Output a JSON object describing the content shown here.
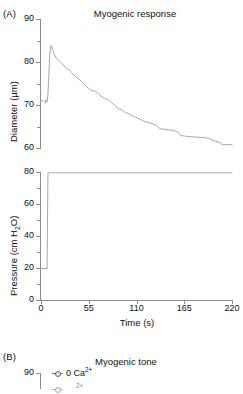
{
  "figure": {
    "panel_a_label": "(A)",
    "panel_b_label": "(B)"
  },
  "chart_data": [
    {
      "type": "line",
      "id": "myogenic-response-diameter",
      "title": "Myogenic response",
      "xlabel": "",
      "ylabel": "Diameter (µm)",
      "xlim": [
        0,
        220
      ],
      "ylim": [
        60,
        90
      ],
      "grid": false,
      "legend": "none",
      "xticks": [
        0,
        55,
        110,
        165,
        220
      ],
      "xticklabels": [
        "0",
        "55",
        "110",
        "165",
        "220"
      ],
      "yticks": [
        60,
        70,
        80,
        90
      ],
      "yticklabels": [
        "60",
        "70",
        "80",
        "90"
      ],
      "yminorticks": [
        65,
        75,
        85
      ],
      "series": [
        {
          "name": "Diameter",
          "color": "#a8a8a8",
          "x": [
            0,
            3,
            5,
            6,
            7,
            8,
            9,
            10,
            11,
            12,
            13,
            15,
            18,
            21,
            25,
            29,
            33,
            37,
            41,
            45,
            49,
            53,
            57,
            61,
            65,
            69,
            73,
            77,
            81,
            85,
            89,
            93,
            97,
            101,
            105,
            109,
            113,
            117,
            121,
            125,
            129,
            133,
            137,
            141,
            145,
            149,
            153,
            157,
            161,
            165,
            169,
            173,
            177,
            181,
            185,
            189,
            193,
            197,
            201,
            205,
            209,
            213,
            217,
            220
          ],
          "y": [
            71.2,
            71.0,
            70.6,
            71.4,
            70.8,
            72.5,
            77.0,
            81.5,
            83.6,
            83.9,
            83.2,
            82.0,
            80.9,
            80.4,
            79.6,
            78.6,
            78.2,
            77.3,
            76.5,
            75.9,
            75.2,
            74.3,
            73.6,
            73.4,
            73.0,
            72.2,
            71.6,
            71.4,
            70.7,
            70.0,
            69.3,
            69.0,
            68.4,
            68.1,
            67.6,
            67.3,
            66.9,
            66.5,
            66.2,
            66.0,
            65.7,
            65.4,
            64.6,
            64.5,
            64.4,
            64.3,
            64.2,
            63.9,
            63.0,
            62.9,
            62.8,
            62.7,
            62.7,
            62.6,
            62.6,
            62.5,
            62.4,
            62.0,
            61.7,
            61.5,
            60.9,
            60.9,
            60.9,
            60.9
          ]
        }
      ]
    },
    {
      "type": "line",
      "id": "myogenic-response-pressure",
      "title": "",
      "xlabel": "Time (s)",
      "ylabel": "Pressure (cm H₂O)",
      "xlim": [
        0,
        220
      ],
      "ylim": [
        0,
        80
      ],
      "grid": false,
      "legend": "none",
      "xticks": [
        0,
        55,
        110,
        165,
        220
      ],
      "xticklabels": [
        "0",
        "55",
        "110",
        "165",
        "220"
      ],
      "yticks": [
        0,
        20,
        40,
        60,
        80
      ],
      "yticklabels": [
        "0",
        "20",
        "40",
        "60",
        "80"
      ],
      "yminorticks": [
        10,
        30,
        50,
        70
      ],
      "series": [
        {
          "name": "Pressure",
          "color": "#a8a8a8",
          "x": [
            0,
            7,
            8,
            9,
            220
          ],
          "y": [
            20,
            20,
            79.5,
            79.8,
            79.8
          ]
        }
      ]
    },
    {
      "type": "line",
      "id": "myogenic-tone",
      "title": "Myogenic tone",
      "xlabel": "",
      "ylabel": "",
      "ylim": [
        null,
        90
      ],
      "grid": false,
      "legend": "upper left",
      "yticks": [
        90
      ],
      "yticklabels": [
        "90"
      ],
      "legend_entries": [
        {
          "label": "0 Ca",
          "superscript": "2+",
          "marker": "open-circle-with-line"
        }
      ],
      "note": "panel clipped at bottom edge of screenshot"
    }
  ]
}
